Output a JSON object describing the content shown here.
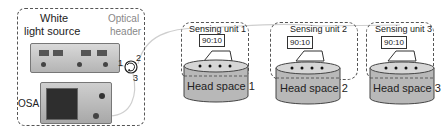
{
  "source_section": {
    "white_light_source_label_line1": "White",
    "white_light_source_label_line2": "light source",
    "optical_header_label_line1": "Optical",
    "optical_header_label_line2": "header",
    "osa_label": "OSA",
    "circulator_ports": [
      "1",
      "2",
      "3"
    ]
  },
  "sensing_units": [
    {
      "title": "Sensing unit 1",
      "coupler_ratio": "90:10",
      "head_space": "Head space 1"
    },
    {
      "title": "Sensing unit 2",
      "coupler_ratio": "90:10",
      "head_space": "Head space 2"
    },
    {
      "title": "Sensing unit 3",
      "coupler_ratio": "90:10",
      "head_space": "Head space 3"
    }
  ],
  "colors": {
    "dash_border": "#555555",
    "header_text": "#888888",
    "tank_fill": "#b8b8b8",
    "tank_top": "#d6d6d6",
    "fiber": "#cfcfcf"
  }
}
